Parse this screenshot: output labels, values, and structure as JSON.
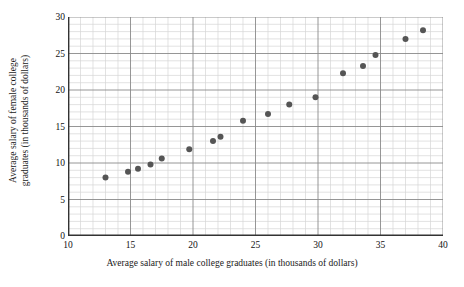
{
  "chart_data": {
    "type": "scatter",
    "title": "",
    "xlabel": "Average salary of male college graduates (in thousands of dollars)",
    "ylabel": "Average salary of female college graduates (in thousands of dollars)",
    "ylabel_line1": "Average salary of female college",
    "ylabel_line2": "graduates (in thousands of dollars)",
    "xlim": [
      10,
      40
    ],
    "ylim": [
      0,
      30
    ],
    "x_major_ticks": [
      10,
      15,
      20,
      25,
      30,
      35,
      40
    ],
    "y_major_ticks": [
      0,
      5,
      10,
      15,
      20,
      25,
      30
    ],
    "x_tick_labels": [
      "10",
      "15",
      "20",
      "25",
      "30",
      "35",
      "40"
    ],
    "y_tick_labels": [
      "0",
      "5",
      "10",
      "15",
      "20",
      "25",
      "30"
    ],
    "x_minor_step": 1,
    "y_minor_step": 1,
    "grid": true,
    "grid_major_color": "#8a8a8a",
    "grid_minor_color": "#d6d6d6",
    "axis_color": "#333333",
    "marker_color": "#555555",
    "marker_size": 3,
    "legend": null,
    "points": [
      {
        "x": 13.0,
        "y": 8.0
      },
      {
        "x": 14.8,
        "y": 8.8
      },
      {
        "x": 15.6,
        "y": 9.2
      },
      {
        "x": 16.6,
        "y": 9.8
      },
      {
        "x": 17.5,
        "y": 10.6
      },
      {
        "x": 19.7,
        "y": 11.9
      },
      {
        "x": 21.6,
        "y": 13.0
      },
      {
        "x": 22.2,
        "y": 13.6
      },
      {
        "x": 24.0,
        "y": 15.8
      },
      {
        "x": 26.0,
        "y": 16.7
      },
      {
        "x": 27.7,
        "y": 18.0
      },
      {
        "x": 29.8,
        "y": 19.0
      },
      {
        "x": 32.0,
        "y": 22.3
      },
      {
        "x": 33.6,
        "y": 23.3
      },
      {
        "x": 34.6,
        "y": 24.8
      },
      {
        "x": 37.0,
        "y": 27.0
      },
      {
        "x": 38.4,
        "y": 28.2
      }
    ]
  }
}
